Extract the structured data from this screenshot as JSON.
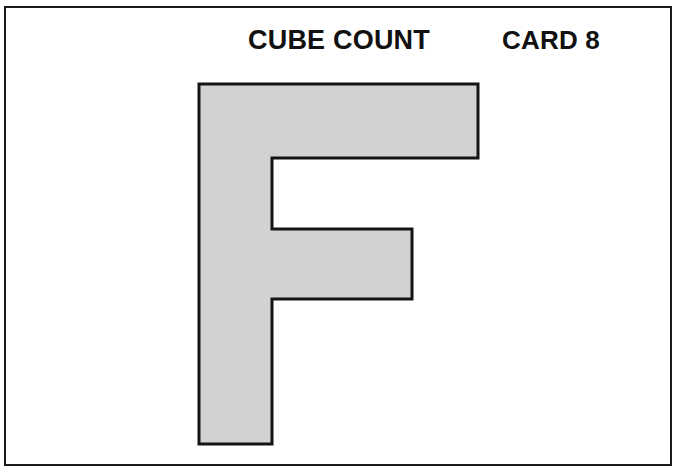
{
  "card": {
    "title": "CUBE COUNT",
    "card_label": "CARD 8",
    "background_color": "#ffffff",
    "frame_color": "#1a1a1a",
    "text_color": "#111111"
  },
  "figure": {
    "name": "f-shape-solid",
    "fill_color": "#d2d2d2",
    "outline_color": "#141414",
    "outline_width": 3,
    "vertices": [
      [
        199,
        84
      ],
      [
        478,
        84
      ],
      [
        478,
        158
      ],
      [
        272,
        158
      ],
      [
        272,
        229
      ],
      [
        412,
        229
      ],
      [
        412,
        299
      ],
      [
        272,
        299
      ],
      [
        272,
        444
      ],
      [
        199,
        444
      ]
    ],
    "points_attr": "199,84 478,84 478,158 272,158 272,229 412,229 412,299 272,299 272,444 199,444"
  }
}
